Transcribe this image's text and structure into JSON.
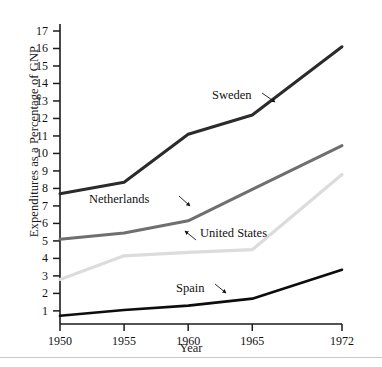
{
  "chart_data": {
    "type": "line",
    "title": "",
    "xlabel": "Year",
    "ylabel": "Expenditures as a Percentage of GNP",
    "x": [
      1950,
      1955,
      1960,
      1965,
      1972
    ],
    "xtick_labels": [
      "1950",
      "1955",
      "1960",
      "1965",
      "1972"
    ],
    "ytick_labels": [
      "1",
      "2",
      "3",
      "4",
      "5",
      "6",
      "7",
      "8",
      "9",
      "10",
      "11",
      "12",
      "13",
      "14",
      "15",
      "16",
      "17"
    ],
    "ylim": [
      0.25,
      17.4
    ],
    "xlim": [
      1950,
      1972
    ],
    "grid": false,
    "legend_position": "inline-annotations",
    "series": [
      {
        "name": "Sweden",
        "color": "#2b2b2b",
        "width": 3.0,
        "values": [
          7.7,
          8.35,
          11.1,
          12.2,
          16.1
        ],
        "label": "Sweden",
        "label_x": 212,
        "label_y": 88,
        "arrow_from_x": 262,
        "arrow_from_y": 93,
        "arrow_to_x": 275,
        "arrow_to_y": 102
      },
      {
        "name": "Netherlands",
        "color": "#6f6f6f",
        "width": 3.0,
        "values": [
          5.1,
          5.45,
          6.15,
          7.95,
          10.45
        ],
        "label": "Netherlands",
        "label_x": 89,
        "label_y": 192,
        "arrow_from_x": 179,
        "arrow_from_y": 196,
        "arrow_to_x": 190,
        "arrow_to_y": 206
      },
      {
        "name": "United States",
        "color": "#dcdcdc",
        "width": 3.2,
        "values": [
          2.8,
          4.15,
          4.35,
          4.5,
          8.8
        ],
        "label": "United States",
        "label_x": 200,
        "label_y": 226,
        "arrow_from_x": 196,
        "arrow_from_y": 240,
        "arrow_to_x": 185,
        "arrow_to_y": 231
      },
      {
        "name": "Spain",
        "color": "#0d0d0d",
        "width": 2.6,
        "values": [
          0.72,
          1.05,
          1.3,
          1.7,
          3.35
        ],
        "label": "Spain",
        "label_x": 176,
        "label_y": 281,
        "arrow_from_x": 215,
        "arrow_from_y": 284,
        "arrow_to_x": 226,
        "arrow_to_y": 293
      }
    ]
  },
  "figure": {
    "axis_color": "#1b1b1b",
    "background": "#ffffff"
  }
}
